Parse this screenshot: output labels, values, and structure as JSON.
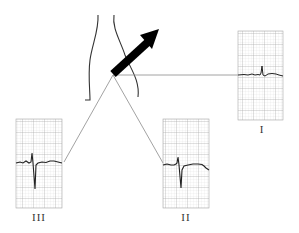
{
  "diagram": {
    "leads": [
      {
        "id": "I",
        "label": "I",
        "position": "right"
      },
      {
        "id": "II",
        "label": "II",
        "position": "bottom-right"
      },
      {
        "id": "III",
        "label": "III",
        "position": "bottom-left"
      }
    ],
    "axis_arrow": {
      "direction": "up-right",
      "color": "#000000"
    },
    "colors": {
      "grid": "#c8c8c8",
      "trace": "#222222",
      "connector": "#888888",
      "outline": "#333333"
    }
  }
}
